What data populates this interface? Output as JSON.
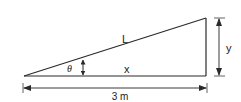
{
  "diagram": {
    "type": "right-triangle-incline",
    "labels": {
      "hypotenuse": "L",
      "base": "x",
      "height": "y",
      "angle": "θ",
      "base_dimension": "3 m"
    },
    "colors": {
      "line": "#2a2a2a",
      "dimension": "#3a3a3a",
      "text": "#222222",
      "background": "#ffffff"
    }
  }
}
